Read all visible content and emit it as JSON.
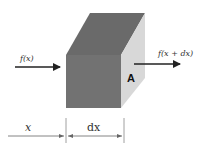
{
  "diagram": {
    "type": "control-volume-flux",
    "colors": {
      "front_face": "#727272",
      "top_face": "#6a6a6a",
      "side_face": "#d8d8d8",
      "arrow": "#222222",
      "dimension_line": "#666666",
      "background": "#ffffff"
    },
    "labels": {
      "inflow": "f(x)",
      "outflow": "f(x + dx)",
      "face": "A",
      "position": "x",
      "width": "dx"
    },
    "elements": [
      {
        "id": "cube",
        "description": "rectangular volume element (box)"
      },
      {
        "id": "inflow-arrow",
        "label": "f(x)",
        "direction": "right",
        "enters": "left face"
      },
      {
        "id": "outflow-arrow",
        "label": "f(x + dx)",
        "direction": "right",
        "exits": "right face A"
      },
      {
        "id": "dimension-x",
        "label": "x"
      },
      {
        "id": "dimension-dx",
        "label": "dx"
      }
    ]
  }
}
